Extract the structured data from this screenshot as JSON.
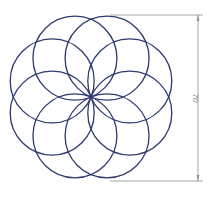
{
  "diagram": {
    "type": "rosette",
    "circle_count": 8,
    "center": [
      91,
      97
    ],
    "circle_radius": 42,
    "stroke_color": "#2e3a6e",
    "dimension": {
      "label": "70",
      "color": "#8a8f99",
      "x": 198,
      "y_top": 15,
      "y_bottom": 181
    }
  }
}
